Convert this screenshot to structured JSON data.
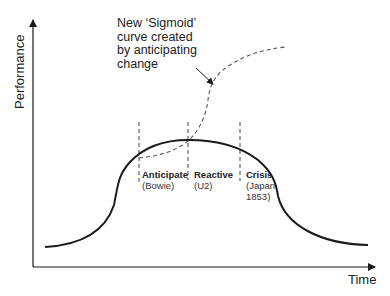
{
  "diagram": {
    "title": "",
    "axes": {
      "y_label": "Performance",
      "x_label": "Time"
    },
    "annotation": {
      "lines": [
        "New ‘Sigmoid’",
        "curve created",
        "by anticipating",
        "change"
      ]
    },
    "phases": [
      {
        "title": "Anticipate",
        "subtitle_lines": [
          "(Bowie)"
        ]
      },
      {
        "title": "Reactive",
        "subtitle_lines": [
          "(U2)"
        ]
      },
      {
        "title": "Crisis",
        "subtitle_lines": [
          "(Japan",
          "1853)"
        ]
      }
    ],
    "curves": [
      {
        "name": "performance-bell-curve",
        "style": "solid"
      },
      {
        "name": "new-sigmoid-curve",
        "style": "dashed"
      }
    ],
    "colors": {
      "line": "#1a1a1a",
      "dashed": "#555555",
      "background": "#ffffff"
    }
  }
}
